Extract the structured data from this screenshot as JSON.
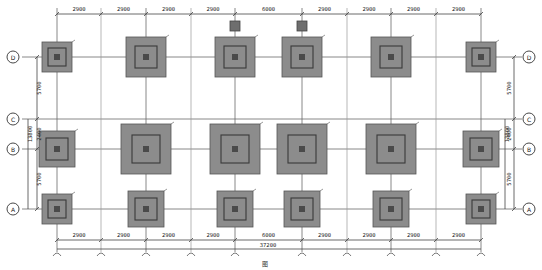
{
  "drawing": {
    "title": "图",
    "type": "foundation plan"
  },
  "axes": {
    "rows": [
      {
        "label": "D",
        "y": 57
      },
      {
        "label": "C",
        "y": 119
      },
      {
        "label": "B",
        "y": 149
      },
      {
        "label": "A",
        "y": 209
      }
    ],
    "columns_x": [
      57,
      146,
      235,
      302,
      391,
      481
    ],
    "secondary_x": [
      101,
      191,
      347,
      436
    ]
  },
  "dimensions": {
    "top": [
      "2900",
      "2900",
      "2900",
      "2900",
      "6000",
      "2900",
      "2900",
      "2900",
      "2900"
    ],
    "bottom": [
      "2900",
      "2900",
      "2900",
      "2900",
      "6000",
      "2900",
      "2900",
      "2900",
      "2900"
    ],
    "total": "37200",
    "left": {
      "d_c": "5700",
      "c_b": "2400",
      "b_a": "5700",
      "c_a_total": "13800"
    },
    "right": {
      "d_c": "5700",
      "c_b": "2400",
      "b_a": "5700",
      "c_a_total": "13800"
    }
  },
  "footings": [
    {
      "row": "D",
      "x": 57,
      "y": 57,
      "outer": 30,
      "inner": 18
    },
    {
      "row": "D",
      "x": 146,
      "y": 57,
      "outer": 40,
      "inner": 22
    },
    {
      "row": "D",
      "x": 235,
      "y": 57,
      "outer": 40,
      "inner": 22
    },
    {
      "row": "D",
      "x": 302,
      "y": 57,
      "outer": 40,
      "inner": 22
    },
    {
      "row": "D",
      "x": 391,
      "y": 57,
      "outer": 40,
      "inner": 22
    },
    {
      "row": "D",
      "x": 481,
      "y": 57,
      "outer": 30,
      "inner": 18
    },
    {
      "row": "B",
      "x": 57,
      "y": 149,
      "outer": 36,
      "inner": 22
    },
    {
      "row": "B",
      "x": 146,
      "y": 149,
      "outer": 50,
      "inner": 28
    },
    {
      "row": "B",
      "x": 235,
      "y": 149,
      "outer": 50,
      "inner": 28
    },
    {
      "row": "B",
      "x": 302,
      "y": 149,
      "outer": 50,
      "inner": 28
    },
    {
      "row": "B",
      "x": 391,
      "y": 149,
      "outer": 50,
      "inner": 28
    },
    {
      "row": "B",
      "x": 481,
      "y": 149,
      "outer": 36,
      "inner": 22
    },
    {
      "row": "A",
      "x": 57,
      "y": 209,
      "outer": 30,
      "inner": 18
    },
    {
      "row": "A",
      "x": 146,
      "y": 209,
      "outer": 36,
      "inner": 22
    },
    {
      "row": "A",
      "x": 235,
      "y": 209,
      "outer": 36,
      "inner": 22
    },
    {
      "row": "A",
      "x": 302,
      "y": 209,
      "outer": 36,
      "inner": 22
    },
    {
      "row": "A",
      "x": 391,
      "y": 209,
      "outer": 36,
      "inner": 22
    },
    {
      "row": "A",
      "x": 481,
      "y": 209,
      "outer": 30,
      "inner": 18
    }
  ],
  "piers": [
    {
      "x": 235,
      "y": 26,
      "size": 10
    },
    {
      "x": 302,
      "y": 26,
      "size": 10
    }
  ],
  "colors": {
    "footing_fill": "#8c8c8c",
    "line": "#6b6b6b",
    "column": "#4a4a4a"
  }
}
